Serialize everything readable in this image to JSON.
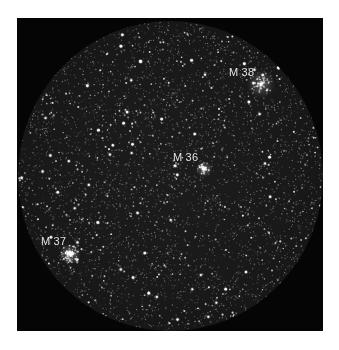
{
  "image": {
    "subject": "Open star clusters in Auriga",
    "background_color": "#ffffff",
    "frame_color": "#050505",
    "field_shape": "circle"
  },
  "labels": [
    {
      "id": "m38",
      "text": "M 38",
      "x": 229,
      "y": 67
    },
    {
      "id": "m36",
      "text": "M 36",
      "x": 173,
      "y": 152
    },
    {
      "id": "m37",
      "text": "M 37",
      "x": 41,
      "y": 236
    }
  ],
  "clusters": [
    {
      "id": "m38",
      "cx": 261,
      "cy": 84,
      "radius": 12,
      "count": 70,
      "brightness": 0.75
    },
    {
      "id": "m36",
      "cx": 204,
      "cy": 169,
      "radius": 7,
      "count": 40,
      "brightness": 0.95
    },
    {
      "id": "m37",
      "cx": 70,
      "cy": 254,
      "radius": 9,
      "count": 80,
      "brightness": 1.0
    }
  ],
  "starfield": {
    "seed": 1337,
    "faint_count": 5200,
    "medium_count": 520,
    "bright_count": 70
  }
}
